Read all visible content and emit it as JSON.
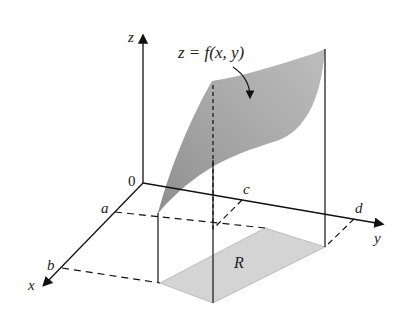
{
  "figure": {
    "surface_label": "z = f(x, y)",
    "region_label": "R",
    "origin_label": "0",
    "axes": {
      "x": "x",
      "y": "y",
      "z": "z"
    },
    "ticks": {
      "a": "a",
      "b": "b",
      "c": "c",
      "d": "d"
    },
    "colors": {
      "surface_fill": "#9a9a9a",
      "surface_light": "#c8c8c8",
      "region_fill": "#d6d6d6",
      "line": "#222222"
    }
  }
}
